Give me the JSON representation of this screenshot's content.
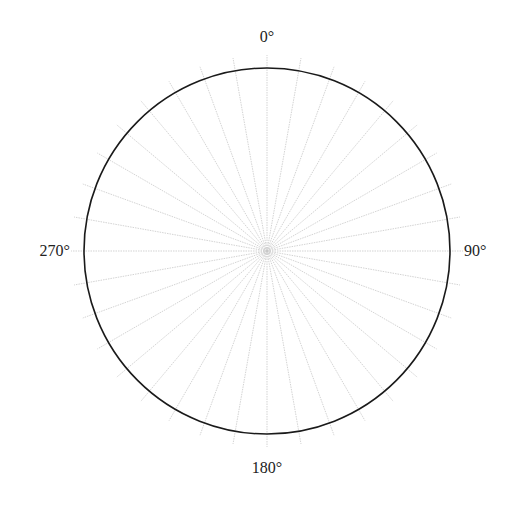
{
  "chart_data": {
    "type": "polar",
    "title": "",
    "angular_tick_labels": [
      "0°",
      "90°",
      "180°",
      "270°"
    ],
    "angular_tick_positions_deg": [
      0,
      90,
      180,
      270
    ],
    "spoke_interval_deg": 10,
    "spoke_count": 36,
    "direction": "clockwise",
    "zero_location": "top",
    "grid": true,
    "series": [],
    "colors": {
      "circle": "#1a1a1a",
      "grid": "#c8c8c8",
      "text": "#222222"
    }
  },
  "labels": {
    "top": "0°",
    "right": "90°",
    "bottom": "180°",
    "left": "270°"
  }
}
